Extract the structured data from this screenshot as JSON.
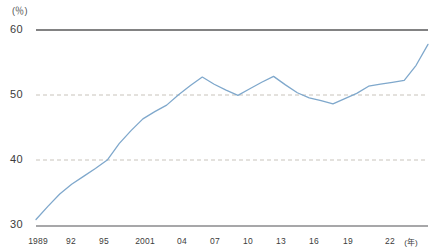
{
  "chart_data": {
    "type": "line",
    "title": "",
    "subtitle": "",
    "xlabel": "年",
    "ylabel": "%",
    "unit_top_left": "(％)",
    "unit_x_right": "(年)",
    "ylim": [
      30,
      60
    ],
    "xlim": [
      1989,
      2022
    ],
    "y_ticks": [
      30,
      40,
      50,
      60
    ],
    "y_tick_labels": [
      "30",
      "40",
      "50",
      "60"
    ],
    "x_ticks": [
      1989,
      1992,
      1995,
      2001,
      2004,
      2007,
      2010,
      2013,
      2016,
      2019,
      2022
    ],
    "x_tick_labels": [
      "1989",
      "92",
      "95",
      "2001",
      "04",
      "07",
      "10",
      "13",
      "16",
      "19",
      "22"
    ],
    "grid": "horizontal-dashed-at-40-and-50",
    "legend": "none",
    "legend_position": "none",
    "series": [
      {
        "name": "series-1",
        "color": "#7fa8cc",
        "x": [
          1989,
          1990,
          1991,
          1992,
          1993,
          1994,
          1995,
          1996,
          1997,
          1998,
          1999,
          2000,
          2001,
          2002,
          2003,
          2004,
          2005,
          2006,
          2007,
          2008,
          2009,
          2010,
          2011,
          2012,
          2013,
          2014,
          2015,
          2016,
          2017,
          2018,
          2019,
          2020,
          2021,
          2022
        ],
        "values": [
          31.0,
          33.0,
          34.9,
          36.4,
          37.6,
          38.8,
          40.1,
          42.6,
          44.6,
          46.4,
          47.5,
          48.5,
          50.1,
          51.5,
          52.8,
          51.7,
          50.8,
          50.0,
          51.0,
          52.0,
          52.9,
          51.6,
          50.4,
          49.6,
          49.2,
          48.7,
          49.5,
          50.3,
          51.4,
          51.7,
          52.0,
          52.3,
          54.6,
          57.8
        ]
      }
    ],
    "colors": {
      "line": "#7fa8cc",
      "grid_dashed": "#c8c3bb",
      "axis_top": "#58585a",
      "axis_bottom": "#8a8a8c",
      "text": "#3c3c3c"
    }
  }
}
